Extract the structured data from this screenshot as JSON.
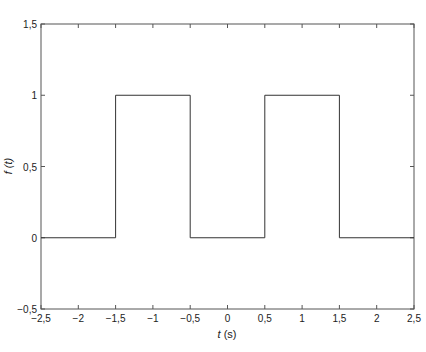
{
  "chart_data": {
    "type": "line",
    "title": "",
    "xlabel": "t (s)",
    "ylabel": "f (t)",
    "xlim": [
      -2.5,
      2.5
    ],
    "ylim": [
      -0.5,
      1.5
    ],
    "grid": false,
    "legend": null,
    "x_ticks": [
      "-2,5",
      "-2",
      "-1,5",
      "-1",
      "-0,5",
      "0",
      "0,5",
      "1",
      "1,5",
      "2",
      "2,5"
    ],
    "y_ticks": [
      "-0,5",
      "0",
      "0,5",
      "1",
      "1,5"
    ],
    "series": [
      {
        "name": "f(t)",
        "color": "#333333",
        "x": [
          -2.5,
          -1.5,
          -1.5,
          -0.5,
          -0.5,
          0.5,
          0.5,
          1.5,
          1.5,
          2.5
        ],
        "y": [
          0,
          0,
          1,
          1,
          0,
          0,
          1,
          1,
          0,
          0
        ]
      }
    ]
  },
  "labels": {
    "xlabel_italic": "t",
    "xlabel_unit": " (s)",
    "ylabel_text": "f (t)"
  }
}
